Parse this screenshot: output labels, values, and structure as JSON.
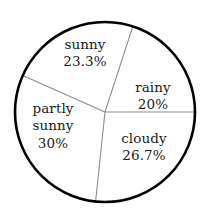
{
  "chart_data": {
    "type": "pie",
    "title": "",
    "subtitle": "",
    "xlabel": "",
    "ylabel": "",
    "legend_position": "none",
    "labels_inside_slices": true,
    "grid": false,
    "categories": [
      "sunny",
      "rainy",
      "cloudy",
      "partly sunny"
    ],
    "values": [
      23.3,
      20,
      26.7,
      30
    ],
    "value_unit": "%",
    "slices": [
      {
        "name": "sunny",
        "label": "sunny",
        "value": 23.3,
        "value_text": "23.3%",
        "sweep_degrees": 84,
        "start_angle": 72,
        "end_angle": 156,
        "fill": "#ffffff"
      },
      {
        "name": "rainy",
        "label": "rainy",
        "value": 20,
        "value_text": "20%",
        "sweep_degrees": 72,
        "start_angle": 0,
        "end_angle": 72,
        "fill": "#ffffff"
      },
      {
        "name": "cloudy",
        "label": "cloudy",
        "value": 26.7,
        "value_text": "26.7%",
        "sweep_degrees": 96,
        "start_angle": 264,
        "end_angle": 360,
        "fill": "#ffffff"
      },
      {
        "name": "partly sunny",
        "label": "partly sunny",
        "label_line_1": "partly",
        "label_line_2": "sunny",
        "value": 30,
        "value_text": "30%",
        "sweep_degrees": 108,
        "start_angle": 156,
        "end_angle": 264,
        "fill": "#ffffff"
      }
    ],
    "colors": {
      "background": "#ffffff",
      "outline": "#000000",
      "divider": "#8c8c8c",
      "text": "#1a1a1a"
    },
    "geometry": {
      "center_x": 105,
      "center_y": 112,
      "radius": 90
    }
  }
}
